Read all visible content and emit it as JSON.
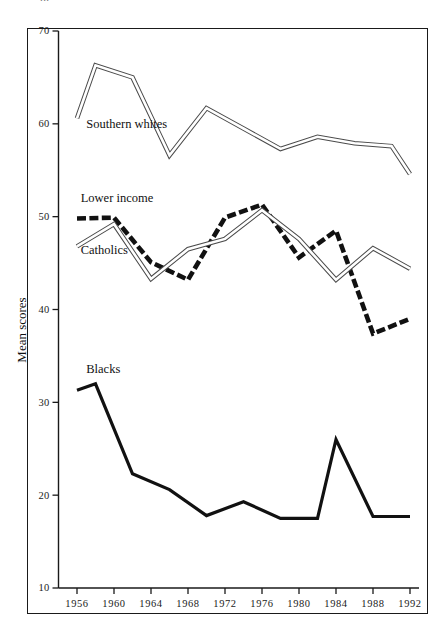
{
  "figure": {
    "cropped_header_text": "...",
    "frame": true
  },
  "chart_data": {
    "type": "line",
    "title": "",
    "subtitle": "",
    "xlabel": "",
    "ylabel": "Mean scores",
    "xlim": [
      1956,
      1994
    ],
    "ylim": [
      10,
      70
    ],
    "yticks": [
      70,
      60,
      50,
      40,
      30,
      20,
      10
    ],
    "xticks": [
      1956,
      1960,
      1964,
      1968,
      1972,
      1976,
      1980,
      1984,
      1988,
      1992
    ],
    "grid": false,
    "legend": "inline-labels",
    "annotations": [
      {
        "text": "Southern whites",
        "series": "Southern whites",
        "x": 1957.0,
        "y": 59.6
      },
      {
        "text": "Lower income",
        "series": "Lower income",
        "x": 1956.4,
        "y": 51.6
      },
      {
        "text": "Catholics",
        "series": "Catholics",
        "x": 1956.4,
        "y": 46.0
      },
      {
        "text": "Blacks",
        "series": "Blacks",
        "x": 1957.0,
        "y": 33.2
      }
    ],
    "series": [
      {
        "name": "Southern whites",
        "style": "double-outline",
        "color": "#555555",
        "x": [
          1956,
          1958,
          1962,
          1966,
          1970,
          1974,
          1978,
          1982,
          1986,
          1990,
          1992
        ],
        "values": [
          60.6,
          66.3,
          65.0,
          56.6,
          61.7,
          59.5,
          57.3,
          58.6,
          57.9,
          57.6,
          54.6
        ]
      },
      {
        "name": "Lower income",
        "style": "dashed-thick",
        "color": "#111111",
        "x": [
          1956,
          1960,
          1964,
          1968,
          1972,
          1976,
          1980,
          1984,
          1988,
          1992
        ],
        "values": [
          49.8,
          49.9,
          45.1,
          43.2,
          49.9,
          51.3,
          45.6,
          48.5,
          37.4,
          39.0
        ]
      },
      {
        "name": "Catholics",
        "style": "double-outline",
        "color": "#555555",
        "x": [
          1956,
          1960,
          1964,
          1968,
          1972,
          1976,
          1980,
          1984,
          1988,
          1992
        ],
        "values": [
          46.8,
          49.2,
          43.3,
          46.5,
          47.6,
          50.7,
          47.6,
          43.2,
          46.6,
          44.4
        ]
      },
      {
        "name": "Blacks",
        "style": "solid-thick",
        "color": "#111111",
        "x": [
          1956,
          1958,
          1962,
          1966,
          1970,
          1974,
          1978,
          1982,
          1984,
          1988,
          1992
        ],
        "values": [
          31.3,
          32.0,
          22.3,
          20.6,
          17.8,
          19.3,
          17.5,
          17.5,
          26.0,
          17.7,
          17.7
        ]
      }
    ]
  },
  "axis": {
    "y_title": "Mean scores",
    "y_labels": [
      "70",
      "60",
      "50",
      "40",
      "30",
      "20",
      "10"
    ],
    "x_labels": [
      "1956",
      "1960",
      "1964",
      "1968",
      "1972",
      "1976",
      "1980",
      "1984",
      "1988",
      "1992"
    ]
  },
  "labels": {
    "southern_whites": "Southern whites",
    "lower_income": "Lower income",
    "catholics": "Catholics",
    "blacks": "Blacks"
  }
}
